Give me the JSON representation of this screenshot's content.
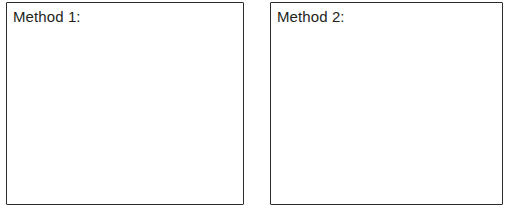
{
  "page": {
    "background_color": "#ffffff",
    "width": 510,
    "height": 224
  },
  "worksheet": {
    "border_color": "#2b2b2b",
    "text_color": "#231f20",
    "boxes": [
      {
        "id": "method-1",
        "label": "Method 1:",
        "content": "",
        "placeholder": ""
      },
      {
        "id": "method-2",
        "label": "Method 2:",
        "content": "",
        "placeholder": ""
      }
    ]
  }
}
